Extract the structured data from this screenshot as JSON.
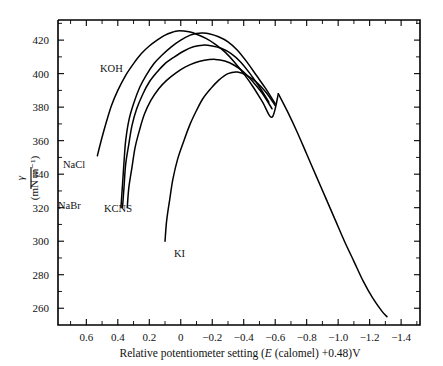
{
  "figure": {
    "title": "",
    "background_color": "#ffffff",
    "line_color": "#000000"
  },
  "axes": {
    "x": {
      "label_parts": {
        "lead": "Relative potentiometer setting (",
        "italic_symbol": "E",
        "mid": " (calomel) +0.48)V"
      },
      "label_full": "Relative potentiometer setting (E (calomel) +0.48)V",
      "ticks": [
        "0.6",
        "0.4",
        "0.2",
        "0",
        "−0.2",
        "−0.4",
        "−0.6",
        "−0.8",
        "−1.0",
        "−1.2",
        "−1.4"
      ],
      "tick_values": [
        0.6,
        0.4,
        0.2,
        0,
        -0.2,
        -0.4,
        -0.6,
        -0.8,
        -1.0,
        -1.2,
        -1.4
      ],
      "range": [
        0.78,
        -1.52
      ],
      "minor_ticks_between": 1,
      "direction": "decreasing-left-to-right"
    },
    "y": {
      "label_numerator": "γ",
      "label_denominator": "(mN m⁻¹)",
      "label_full": "γ / (mN m⁻¹)",
      "ticks": [
        "260",
        "280",
        "300",
        "320",
        "340",
        "360",
        "380",
        "400",
        "420"
      ],
      "tick_values": [
        260,
        280,
        300,
        320,
        340,
        360,
        380,
        400,
        420
      ],
      "range": [
        250,
        432
      ],
      "minor_ticks_between": 1
    }
  },
  "curve_labels": [
    {
      "id": "koh",
      "text": "KOH",
      "x": 100,
      "y": 72
    },
    {
      "id": "nacl",
      "text": "NaCl",
      "x": 63,
      "y": 168
    },
    {
      "id": "nabr",
      "text": "NaBr",
      "x": 58,
      "y": 209
    },
    {
      "id": "kcns",
      "text": "KCNS",
      "x": 104,
      "y": 212
    },
    {
      "id": "ki",
      "text": "KI",
      "x": 174,
      "y": 257
    }
  ],
  "chart_data": {
    "type": "line",
    "title": "",
    "xlabel": "Relative potentiometer setting (E (calomel) +0.48)V",
    "ylabel": "γ / (mN m⁻¹)",
    "xlim": [
      0.78,
      -1.52
    ],
    "ylim": [
      250,
      432
    ],
    "xticks": [
      0.6,
      0.4,
      0.2,
      0,
      -0.2,
      -0.4,
      -0.6,
      -0.8,
      -1.0,
      -1.2,
      -1.4
    ],
    "yticks": [
      260,
      280,
      300,
      320,
      340,
      360,
      380,
      400,
      420
    ],
    "grid": false,
    "legend": "inline-labels",
    "series": [
      {
        "name": "KOH",
        "label": "KOH",
        "maximum": {
          "x": 0.02,
          "y": 425.5
        },
        "points": [
          [
            0.53,
            351
          ],
          [
            0.5,
            362
          ],
          [
            0.47,
            372
          ],
          [
            0.44,
            381
          ],
          [
            0.4,
            390
          ],
          [
            0.35,
            399
          ],
          [
            0.3,
            406
          ],
          [
            0.25,
            412
          ],
          [
            0.2,
            416.5
          ],
          [
            0.15,
            420
          ],
          [
            0.1,
            423
          ],
          [
            0.05,
            424.8
          ],
          [
            0.02,
            425.5
          ],
          [
            -0.02,
            425.4
          ],
          [
            -0.06,
            424.8
          ],
          [
            -0.1,
            423.5
          ],
          [
            -0.16,
            421
          ],
          [
            -0.22,
            417.5
          ],
          [
            -0.28,
            413
          ],
          [
            -0.34,
            407
          ],
          [
            -0.4,
            400
          ],
          [
            -0.46,
            392
          ],
          [
            -0.52,
            383
          ],
          [
            -0.58,
            374
          ],
          [
            -0.62,
            388
          ]
        ]
      },
      {
        "name": "NaCl",
        "label": "NaCl",
        "maximum": {
          "x": -0.06,
          "y": 424.2
        },
        "points": [
          [
            0.38,
            320
          ],
          [
            0.37,
            334
          ],
          [
            0.36,
            348
          ],
          [
            0.35,
            360
          ],
          [
            0.33,
            372
          ],
          [
            0.3,
            382
          ],
          [
            0.26,
            392
          ],
          [
            0.22,
            399
          ],
          [
            0.17,
            406
          ],
          [
            0.12,
            411
          ],
          [
            0.06,
            416
          ],
          [
            0.0,
            420
          ],
          [
            -0.06,
            423
          ],
          [
            -0.1,
            424
          ],
          [
            -0.14,
            424.2
          ],
          [
            -0.18,
            423.8
          ],
          [
            -0.24,
            422
          ],
          [
            -0.3,
            419
          ],
          [
            -0.36,
            414
          ],
          [
            -0.42,
            407
          ],
          [
            -0.48,
            399
          ],
          [
            -0.54,
            391
          ],
          [
            -0.6,
            382
          ]
        ]
      },
      {
        "name": "NaBr",
        "label": "NaBr",
        "maximum": {
          "x": -0.15,
          "y": 417
        },
        "points": [
          [
            0.37,
            320
          ],
          [
            0.36,
            333
          ],
          [
            0.35,
            346
          ],
          [
            0.33,
            358
          ],
          [
            0.31,
            369
          ],
          [
            0.28,
            379
          ],
          [
            0.24,
            388
          ],
          [
            0.2,
            395
          ],
          [
            0.15,
            401
          ],
          [
            0.1,
            406
          ],
          [
            0.04,
            410
          ],
          [
            -0.02,
            413.5
          ],
          [
            -0.08,
            416
          ],
          [
            -0.14,
            417
          ],
          [
            -0.2,
            416.5
          ],
          [
            -0.26,
            415
          ],
          [
            -0.32,
            412
          ],
          [
            -0.38,
            407
          ],
          [
            -0.44,
            400
          ],
          [
            -0.5,
            392
          ],
          [
            -0.56,
            383
          ]
        ]
      },
      {
        "name": "KCNS",
        "label": "KCNS",
        "maximum": {
          "x": -0.22,
          "y": 408.5
        },
        "points": [
          [
            0.34,
            320
          ],
          [
            0.33,
            332
          ],
          [
            0.31,
            344
          ],
          [
            0.29,
            356
          ],
          [
            0.26,
            367
          ],
          [
            0.23,
            376
          ],
          [
            0.19,
            384
          ],
          [
            0.14,
            391
          ],
          [
            0.09,
            396
          ],
          [
            0.03,
            400.5
          ],
          [
            -0.03,
            404
          ],
          [
            -0.09,
            406.5
          ],
          [
            -0.15,
            408
          ],
          [
            -0.22,
            408.5
          ],
          [
            -0.28,
            407.5
          ],
          [
            -0.34,
            405
          ],
          [
            -0.4,
            401
          ],
          [
            -0.46,
            395
          ],
          [
            -0.52,
            388
          ],
          [
            -0.58,
            379
          ]
        ]
      },
      {
        "name": "KI",
        "label": "KI",
        "maximum": {
          "x": -0.3,
          "y": 401
        },
        "points": [
          [
            0.1,
            300
          ],
          [
            0.09,
            312
          ],
          [
            0.07,
            325
          ],
          [
            0.05,
            337
          ],
          [
            0.02,
            349
          ],
          [
            -0.02,
            360
          ],
          [
            -0.06,
            370
          ],
          [
            -0.1,
            378
          ],
          [
            -0.14,
            385
          ],
          [
            -0.19,
            391
          ],
          [
            -0.24,
            396
          ],
          [
            -0.3,
            400
          ],
          [
            -0.36,
            401
          ],
          [
            -0.42,
            399
          ],
          [
            -0.48,
            395
          ],
          [
            -0.54,
            389
          ],
          [
            -0.6,
            381
          ]
        ]
      },
      {
        "name": "common-descending-branch",
        "label": "",
        "points": [
          [
            -0.62,
            388
          ],
          [
            -0.68,
            377
          ],
          [
            -0.74,
            365
          ],
          [
            -0.8,
            352
          ],
          [
            -0.86,
            339
          ],
          [
            -0.92,
            326
          ],
          [
            -0.98,
            313
          ],
          [
            -1.04,
            300
          ],
          [
            -1.1,
            288
          ],
          [
            -1.16,
            276
          ],
          [
            -1.22,
            266
          ],
          [
            -1.28,
            258
          ],
          [
            -1.31,
            255
          ]
        ]
      }
    ]
  }
}
